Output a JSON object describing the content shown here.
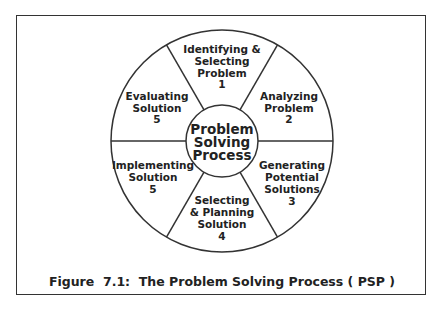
{
  "diagram": {
    "center": {
      "lines": [
        "Problem",
        "Solving",
        "Process"
      ]
    },
    "segments": [
      {
        "id": "identifying",
        "lines": [
          "Identifying &",
          "Selecting",
          "Problem",
          "1"
        ]
      },
      {
        "id": "analyzing",
        "lines": [
          "Analyzing",
          "Problem",
          "2"
        ]
      },
      {
        "id": "generating",
        "lines": [
          "Generating",
          "Potential",
          "Solutions",
          "3"
        ]
      },
      {
        "id": "selecting",
        "lines": [
          "Selecting",
          "& Planning",
          "Solution",
          "4"
        ]
      },
      {
        "id": "implementing",
        "lines": [
          "Implementing",
          "Solution",
          "5"
        ]
      },
      {
        "id": "evaluating",
        "lines": [
          "Evaluating",
          "Solution",
          "5"
        ]
      }
    ],
    "caption": "Figure  7.1:  The Problem Solving Process ( PSP )",
    "colors": {
      "stroke": "#333333",
      "text": "#222222",
      "background": "#ffffff"
    }
  }
}
